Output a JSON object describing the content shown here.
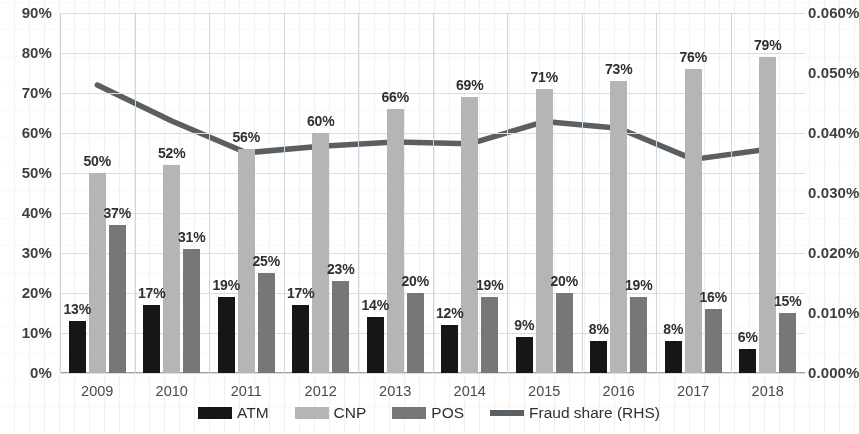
{
  "chart_data": {
    "type": "bar",
    "title": "",
    "subtitle": "",
    "xlabel": "",
    "ylabel": "",
    "categories": [
      "2009",
      "2010",
      "2011",
      "2012",
      "2013",
      "2014",
      "2015",
      "2016",
      "2017",
      "2018"
    ],
    "series": [
      {
        "name": "ATM",
        "axis": "left",
        "type": "bar",
        "color": "#161616",
        "values": [
          13,
          17,
          19,
          17,
          14,
          12,
          9,
          8,
          8,
          6
        ],
        "labels": [
          "13%",
          "17%",
          "19%",
          "17%",
          "14%",
          "12%",
          "9%",
          "8%",
          "8%",
          "6%"
        ]
      },
      {
        "name": "CNP",
        "axis": "left",
        "type": "bar",
        "color": "#b5b5b5",
        "values": [
          50,
          52,
          56,
          60,
          66,
          69,
          71,
          73,
          76,
          79
        ],
        "labels": [
          "50%",
          "52%",
          "56%",
          "60%",
          "66%",
          "69%",
          "71%",
          "73%",
          "76%",
          "79%"
        ]
      },
      {
        "name": "POS",
        "axis": "left",
        "type": "bar",
        "color": "#777777",
        "values": [
          37,
          31,
          25,
          23,
          20,
          19,
          20,
          19,
          16,
          15
        ],
        "labels": [
          "37%",
          "31%",
          "25%",
          "23%",
          "20%",
          "19%",
          "20%",
          "19%",
          "16%",
          "15%"
        ]
      },
      {
        "name": "Fraud share (RHS)",
        "axis": "right",
        "type": "line",
        "color": "#5a5f63",
        "values": [
          0.048,
          0.042,
          0.0367,
          0.0378,
          0.0385,
          0.0382,
          0.0419,
          0.0408,
          0.0356,
          0.0373
        ]
      }
    ],
    "left_axis": {
      "min": 0,
      "max": 90,
      "step": 10,
      "ticks": [
        "0%",
        "10%",
        "20%",
        "30%",
        "40%",
        "50%",
        "60%",
        "70%",
        "80%",
        "90%"
      ]
    },
    "right_axis": {
      "min": 0,
      "max": 0.06,
      "step": 0.01,
      "ticks": [
        "0.000%",
        "0.010%",
        "0.020%",
        "0.030%",
        "0.040%",
        "0.050%",
        "0.060%"
      ]
    },
    "grid": true,
    "legend_position": "bottom"
  },
  "legend": {
    "items": [
      {
        "label": "ATM",
        "marker": "swatch",
        "color": "#161616"
      },
      {
        "label": "CNP",
        "marker": "swatch",
        "color": "#b5b5b5"
      },
      {
        "label": "POS",
        "marker": "swatch",
        "color": "#777777"
      },
      {
        "label": "Fraud share (RHS)",
        "marker": "line",
        "color": "#5a5f63"
      }
    ]
  }
}
